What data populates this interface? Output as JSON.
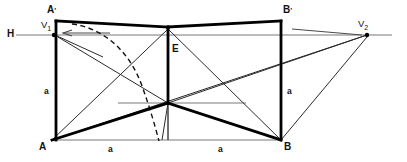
{
  "figure": {
    "kind": "two-point-perspective-construction-diagram",
    "background_color": "#ffffff",
    "ink_color": "#000000",
    "construction_line_color": "#555555",
    "labels": {
      "horizon": "H",
      "vanishing_point_left": "V",
      "vanishing_point_left_sub": "1",
      "vanishing_point_right": "V",
      "vanishing_point_right_sub": "2",
      "corner_front_bottom_left": "A",
      "corner_front_bottom_right": "B",
      "corner_top_left": "A",
      "corner_top_left_prime": "'",
      "corner_top_right": "B",
      "corner_top_right_prime": "'",
      "apex": "E",
      "side_left_length": "a",
      "side_right_length": "a",
      "base_left_length": "a",
      "base_right_length": "a"
    },
    "points": {
      "A": [
        52,
        140
      ],
      "B": [
        281,
        140
      ],
      "A_prime": [
        56,
        22
      ],
      "B_prime": [
        281,
        22
      ],
      "V1": [
        53,
        35
      ],
      "V2": [
        367,
        35
      ],
      "E": [
        168,
        29
      ],
      "center": [
        168,
        103
      ],
      "base_mid": [
        168,
        140
      ]
    },
    "horizon_y": 35,
    "base_y": 140
  }
}
